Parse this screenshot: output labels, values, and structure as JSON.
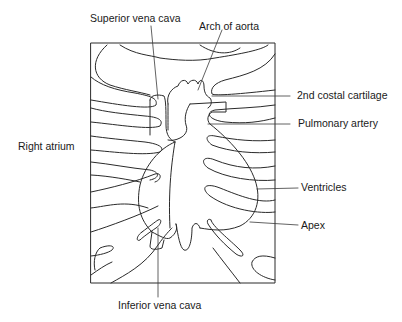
{
  "diagram": {
    "type": "anatomical-diagram",
    "line_color": "#2a2a2a",
    "labels": [
      {
        "id": "superior-vena-cava",
        "text": "Superior vena cava"
      },
      {
        "id": "arch-of-aorta",
        "text": "Arch of aorta"
      },
      {
        "id": "second-costal-cartilage",
        "text": "2nd costal cartilage"
      },
      {
        "id": "pulmonary-artery",
        "text": "Pulmonary artery"
      },
      {
        "id": "right-atrium",
        "text": "Right atrium"
      },
      {
        "id": "ventricles",
        "text": "Ventricles"
      },
      {
        "id": "apex",
        "text": "Apex"
      },
      {
        "id": "inferior-vena-cava",
        "text": "Inferior vena cava"
      }
    ]
  }
}
